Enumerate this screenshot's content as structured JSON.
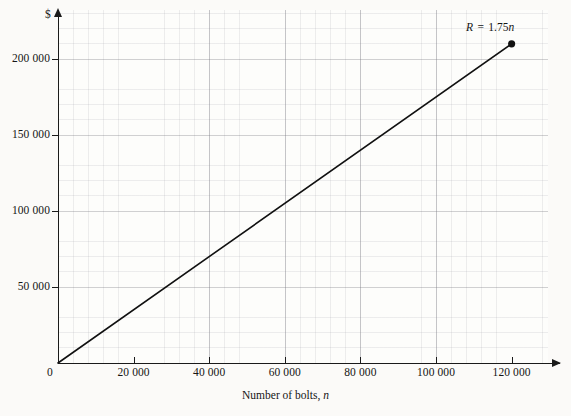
{
  "chart_data": {
    "type": "line",
    "title": "",
    "subtitle": "",
    "xlabel": "Number of bolts, n",
    "ylabel": "$",
    "xlim": [
      0,
      130000
    ],
    "ylim": [
      0,
      220000
    ],
    "grid": true,
    "grid_major_x": 20000,
    "grid_major_y": 50000,
    "grid_minor_divisions": 5,
    "legend": "none",
    "annotations": [
      {
        "name": "equation-label",
        "text": "R = 1.75n",
        "symbol": "R",
        "operator": "=",
        "slope": "1.75",
        "variable": "n",
        "at_x": 120000,
        "at_y": 210000
      }
    ],
    "series": [
      {
        "name": "R = 1.75n",
        "type": "line",
        "color": "#111111",
        "x": [
          0,
          120000
        ],
        "values": [
          0,
          210000
        ],
        "slope": 1.75,
        "intercept": 0,
        "endpoint_marker": {
          "x": 120000,
          "y": 210000,
          "shape": "circle",
          "color": "#111111"
        }
      }
    ],
    "xticks": [
      0,
      20000,
      40000,
      60000,
      80000,
      100000,
      120000
    ],
    "xtick_labels": [
      "0",
      "20 000",
      "40 000",
      "60 000",
      "80 000",
      "100 000",
      "120 000"
    ],
    "yticks": [
      0,
      50000,
      100000,
      150000,
      200000
    ],
    "ytick_labels": [
      "0",
      "50 000",
      "100 000",
      "150 000",
      "200 000"
    ]
  },
  "axes": {
    "y_symbol": "$",
    "x_title_prefix": "Number of bolts,",
    "x_title_var": "n",
    "origin_label": "0"
  },
  "colors": {
    "background": "#fbfaf8",
    "plot_background": "#fdfdfb",
    "axis": "#1a1a1a",
    "series": "#111111",
    "grid_major": "#787880",
    "grid_minor": "#96969e",
    "text": "#151515"
  }
}
